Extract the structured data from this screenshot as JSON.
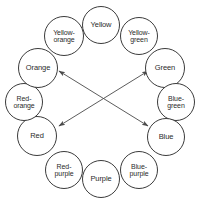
{
  "diagram": {
    "type": "color-wheel-diagram",
    "background_color": "#ffffff",
    "node_fill_color": "#ffffff",
    "node_stroke_color": "#3b3b3b",
    "arrow_color": "#4a4a4a",
    "text_color": "#2b2b2b",
    "nodes": [
      {
        "id": "yellow",
        "label": "Yellow",
        "cx": 101,
        "cy": 25,
        "r": 19,
        "font_size": 7.5
      },
      {
        "id": "yellow-green",
        "label": "Yellow-\ngreen",
        "cx": 139,
        "cy": 36,
        "r": 19,
        "font_size": 7.0
      },
      {
        "id": "green",
        "label": "Green",
        "cx": 165,
        "cy": 68,
        "r": 20,
        "font_size": 7.5
      },
      {
        "id": "blue-green",
        "label": "Blue-\ngreen",
        "cx": 176,
        "cy": 102,
        "r": 19,
        "font_size": 7.0
      },
      {
        "id": "blue",
        "label": "Blue",
        "cx": 166,
        "cy": 137,
        "r": 19,
        "font_size": 7.5
      },
      {
        "id": "blue-purple",
        "label": "Blue-\npurple",
        "cx": 139,
        "cy": 170,
        "r": 19,
        "font_size": 7.0
      },
      {
        "id": "purple",
        "label": "Purple",
        "cx": 101,
        "cy": 179,
        "r": 19,
        "font_size": 7.5
      },
      {
        "id": "red-purple",
        "label": "Red-\npurple",
        "cx": 64,
        "cy": 170,
        "r": 19,
        "font_size": 7.0
      },
      {
        "id": "red",
        "label": "Red",
        "cx": 37,
        "cy": 136,
        "r": 20,
        "font_size": 7.5
      },
      {
        "id": "red-orange",
        "label": "Red-\norange",
        "cx": 24,
        "cy": 102,
        "r": 19,
        "font_size": 7.0
      },
      {
        "id": "orange",
        "label": "Orange",
        "cx": 38,
        "cy": 68,
        "r": 20,
        "font_size": 7.5
      },
      {
        "id": "yellow-orange",
        "label": "Yellow-\norange",
        "cx": 64,
        "cy": 36,
        "r": 20,
        "font_size": 7.0
      }
    ],
    "connectors": [
      {
        "id": "orange-blue",
        "from": "orange",
        "to": "blue",
        "style": "double-headed-arrow",
        "x1": 59,
        "y1": 71,
        "x2": 148,
        "y2": 126
      },
      {
        "id": "red-green",
        "from": "red",
        "to": "green",
        "style": "double-headed-arrow",
        "x1": 59,
        "y1": 126,
        "x2": 148,
        "y2": 71
      }
    ]
  }
}
